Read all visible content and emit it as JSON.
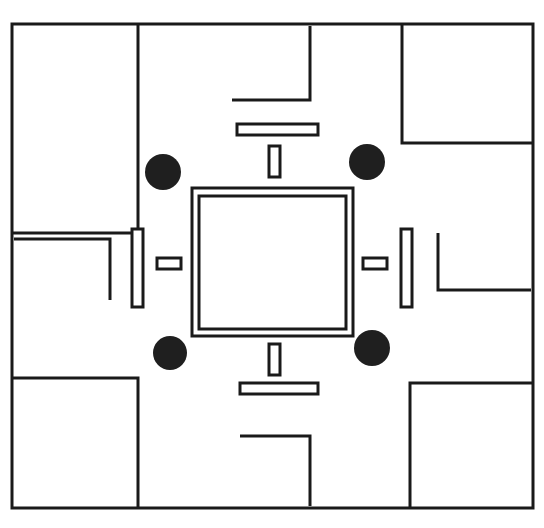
{
  "figure": {
    "canvas": {
      "width": 544,
      "height": 528,
      "background": "#ffffff"
    },
    "ink_color": "#1a1a1a",
    "via_color": "#1f1f1f",
    "line_weights": {
      "frame": 3,
      "bracket": 3,
      "slot": 3,
      "patch": 3
    }
  },
  "outer_frame": {
    "name": "outer-border-frame",
    "left": 12,
    "top": 24,
    "right": 533,
    "bottom": 508,
    "stroke_width": 3
  },
  "corner_brackets": [
    {
      "name": "bracket-top-left",
      "points": "12,233 138,233 138,24",
      "orientation": "top-left",
      "stroke_width": 3
    },
    {
      "name": "bracket-top-right",
      "points": "533,143 402,143 402,24",
      "orientation": "top-right",
      "stroke_width": 3
    },
    {
      "name": "bracket-bottom-left",
      "points": "12,378 138,378 138,508",
      "orientation": "bottom-left",
      "stroke_width": 3
    },
    {
      "name": "bracket-bottom-right",
      "points": "533,383 410,383 410,508",
      "orientation": "bottom-right",
      "stroke_width": 3
    }
  ],
  "inner_brackets": [
    {
      "name": "inner-bracket-left",
      "points": "14,239 110,239 110,300",
      "stroke_width": 3
    },
    {
      "name": "inner-bracket-right",
      "points": "531,290 438,290 438,233",
      "stroke_width": 3
    },
    {
      "name": "inner-bracket-top",
      "points": "232,100 310,100 310,26",
      "stroke_width": 3
    },
    {
      "name": "inner-bracket-bottom",
      "points": "240,436 310,436 310,506",
      "stroke_width": 3
    }
  ],
  "center_patch": {
    "name": "center-square-radiator",
    "outer": {
      "x": 192,
      "y": 188,
      "width": 161,
      "height": 148
    },
    "inner": {
      "x": 199,
      "y": 196,
      "width": 147,
      "height": 133
    },
    "stroke_width": 3
  },
  "slots": [
    {
      "name": "slot-top-horizontal-long",
      "x": 237,
      "y": 124,
      "width": 81,
      "height": 11
    },
    {
      "name": "slot-top-vertical-stub",
      "x": 269,
      "y": 146,
      "width": 11,
      "height": 31
    },
    {
      "name": "slot-bottom-vertical-stub",
      "x": 269,
      "y": 344,
      "width": 11,
      "height": 31
    },
    {
      "name": "slot-bottom-horizontal-long",
      "x": 240,
      "y": 383,
      "width": 78,
      "height": 11
    },
    {
      "name": "slot-left-vertical-long",
      "x": 132,
      "y": 229,
      "width": 11,
      "height": 78
    },
    {
      "name": "slot-left-horizontal-stub",
      "x": 157,
      "y": 258,
      "width": 24,
      "height": 11
    },
    {
      "name": "slot-right-vertical-long",
      "x": 401,
      "y": 229,
      "width": 11,
      "height": 78
    },
    {
      "name": "slot-right-horizontal-stub",
      "x": 363,
      "y": 258,
      "width": 24,
      "height": 11
    }
  ],
  "vias": [
    {
      "name": "via-top-left",
      "cx": 163,
      "cy": 172,
      "r": 18
    },
    {
      "name": "via-top-right",
      "cx": 367,
      "cy": 162,
      "r": 18
    },
    {
      "name": "via-bottom-left",
      "cx": 170,
      "cy": 353,
      "r": 17
    },
    {
      "name": "via-bottom-right",
      "cx": 372,
      "cy": 348,
      "r": 18
    }
  ]
}
